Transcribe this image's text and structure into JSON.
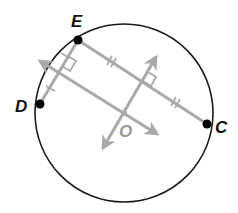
{
  "diagram": {
    "type": "circle-chords-perpendicular-bisectors",
    "colors": {
      "circle": "#1a1a1a",
      "construction": "#a9a9a9",
      "point": "#000000",
      "label": "#111111",
      "center_label": "#9a9a9a"
    },
    "circle": {
      "cx": 124,
      "cy": 113,
      "r": 89
    },
    "points": [
      {
        "name": "E",
        "label": "E",
        "x": 78,
        "y": 40,
        "label_x": 71,
        "label_y": 27
      },
      {
        "name": "D",
        "label": "D",
        "x": 40,
        "y": 104,
        "label_x": 15,
        "label_y": 112
      },
      {
        "name": "C",
        "label": "C",
        "x": 207,
        "y": 124,
        "label_x": 215,
        "label_y": 133
      },
      {
        "name": "O",
        "label": "O",
        "x": 124,
        "y": 113,
        "label_x": 119,
        "label_y": 137
      }
    ],
    "chords": [
      {
        "from": "E",
        "to": "D",
        "tick_marks": 1
      },
      {
        "from": "E",
        "to": "C",
        "tick_marks": 2
      }
    ],
    "bisectors": [
      {
        "of_chord": "ED",
        "through": "O",
        "arrow_end_1": [
          34,
          57
        ],
        "arrow_end_2": [
          163,
          138
        ],
        "right_angle": true
      },
      {
        "of_chord": "EC",
        "through": "O",
        "arrow_end_1": [
          160,
          51
        ],
        "arrow_end_2": [
          99,
          154
        ],
        "right_angle": true
      }
    ]
  }
}
